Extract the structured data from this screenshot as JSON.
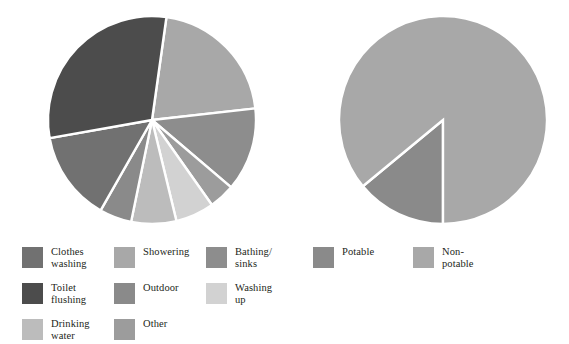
{
  "figure": {
    "background": "#ffffff",
    "separator_color": "#ffffff",
    "text_color": "#231f20"
  },
  "chart_data": [
    {
      "id": "household-water-use-by-activity",
      "type": "pie",
      "title": "",
      "position": "left",
      "center": [
        104,
        104
      ],
      "radius": 104,
      "start_angle_deg": 8,
      "direction": "clockwise",
      "legend": "bottom-left",
      "categories": [
        "Showering",
        "Bathing/ sinks",
        "Other",
        "Washing up",
        "Drinking water",
        "Outdoor",
        "Clothes washing",
        "Toilet flushing"
      ],
      "values": [
        21,
        13,
        4,
        6,
        7,
        5,
        14,
        30
      ],
      "colors": [
        "#a8a8a8",
        "#8d8d8d",
        "#9c9c9c",
        "#d2d2d2",
        "#bcbcbc",
        "#8a8a8a",
        "#717171",
        "#4c4c4c"
      ],
      "unit": "percent",
      "xlabel": "",
      "ylabel": ""
    },
    {
      "id": "potable-vs-non-potable",
      "type": "pie",
      "title": "",
      "position": "right",
      "center": [
        104,
        104
      ],
      "radius": 104,
      "start_angle_deg": 180,
      "direction": "clockwise",
      "legend": "bottom-right",
      "categories": [
        "Potable",
        "Non-potable"
      ],
      "values": [
        14,
        86
      ],
      "colors": [
        "#8a8a8a",
        "#a8a8a8"
      ],
      "unit": "percent",
      "xlabel": "",
      "ylabel": ""
    }
  ],
  "legend_left": {
    "columns": [
      {
        "items": [
          {
            "label": "Clothes\nwashing",
            "color": "#717171"
          },
          {
            "label": "Toilet\nflushing",
            "color": "#4c4c4c"
          },
          {
            "label": "Drinking\nwater",
            "color": "#bcbcbc"
          }
        ]
      },
      {
        "items": [
          {
            "label": "Showering",
            "color": "#a8a8a8"
          },
          {
            "label": "Outdoor",
            "color": "#8a8a8a"
          },
          {
            "label": "Other",
            "color": "#9c9c9c"
          }
        ]
      },
      {
        "items": [
          {
            "label": "Bathing/\nsinks",
            "color": "#8d8d8d"
          },
          {
            "label": "Washing\nup",
            "color": "#d2d2d2"
          }
        ]
      }
    ]
  },
  "legend_right": {
    "columns": [
      {
        "items": [
          {
            "label": "Potable",
            "color": "#8a8a8a"
          }
        ]
      },
      {
        "items": [
          {
            "label": "Non-\npotable",
            "color": "#a8a8a8"
          }
        ]
      }
    ]
  }
}
